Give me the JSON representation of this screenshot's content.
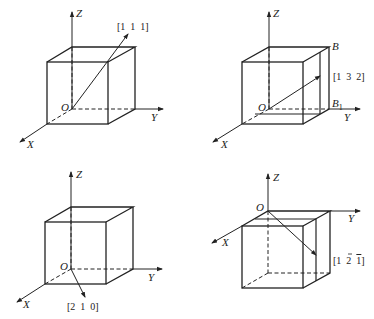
{
  "panels": [
    {
      "id": "a",
      "axes": {
        "x": "X",
        "y": "Y",
        "z": "Z",
        "origin": "O"
      },
      "direction": "[1  1  1]",
      "points": {}
    },
    {
      "id": "b",
      "axes": {
        "x": "X",
        "y": "Y",
        "z": "Z",
        "origin": "O"
      },
      "direction": "[1  3  2]",
      "points": {
        "B": "B",
        "B1": "B",
        "B1_sub": "1"
      }
    },
    {
      "id": "c",
      "axes": {
        "x": "X",
        "y": "Y",
        "z": "Z",
        "origin": "O"
      },
      "direction": "[2  1  0]",
      "points": {}
    },
    {
      "id": "d",
      "axes": {
        "x": "X",
        "y": "Y",
        "z": "Z",
        "origin": "O"
      },
      "direction_prefix": "[1  2  ",
      "direction_bar_digit": "1",
      "direction_suffix": "]",
      "points": {}
    }
  ]
}
